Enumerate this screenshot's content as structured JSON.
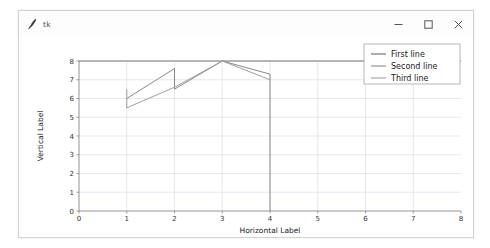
{
  "window": {
    "title": "tk",
    "icon": "matplotlib-feather-icon",
    "controls": [
      {
        "name": "minimize",
        "glyph": "minimize-icon"
      },
      {
        "name": "maximize",
        "glyph": "maximize-icon"
      },
      {
        "name": "close",
        "glyph": "close-icon"
      }
    ]
  },
  "chart_data": {
    "type": "line",
    "title": "",
    "xlabel": "Horizontal Label",
    "ylabel": "Vertical Label",
    "xlim": [
      0,
      8
    ],
    "ylim": [
      0,
      8
    ],
    "xticks": [
      "0",
      "1",
      "2",
      "3",
      "4",
      "5",
      "6",
      "7",
      "8"
    ],
    "yticks": [
      "0",
      "1",
      "2",
      "3",
      "4",
      "5",
      "6",
      "7",
      "8"
    ],
    "grid": true,
    "legend_position": "upper right",
    "series": [
      {
        "name": "First line",
        "color": "#6b6b6b",
        "x": [
          0,
          1,
          2,
          3,
          4,
          5,
          6,
          7,
          8
        ],
        "y": [
          8,
          8,
          8,
          8,
          8,
          8,
          8,
          8,
          8
        ]
      },
      {
        "name": "Second line",
        "color": "#8a8a8a",
        "x": [
          1,
          2,
          2,
          3,
          4,
          4
        ],
        "y": [
          6.0,
          7.6,
          6.5,
          8.0,
          7.3,
          0.0
        ]
      },
      {
        "name": "Third line",
        "color": "#a0a0a0",
        "x": [
          1,
          1,
          2,
          3,
          4
        ],
        "y": [
          6.5,
          5.5,
          6.6,
          8.0,
          7.0
        ]
      }
    ]
  },
  "legend": {
    "entries": [
      "First line",
      "Second line",
      "Third line"
    ]
  }
}
